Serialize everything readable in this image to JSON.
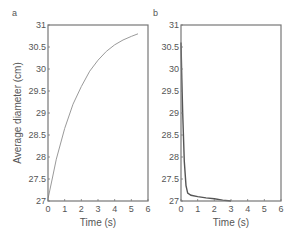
{
  "chart_data": [
    {
      "panel": "a",
      "type": "line",
      "title": "",
      "xlabel": "Time (s)",
      "ylabel": "Average diameter (cm)",
      "xlim": [
        0,
        6
      ],
      "ylim": [
        27,
        31
      ],
      "xticks": [
        0,
        1,
        2,
        3,
        4,
        5,
        6
      ],
      "yticks": [
        27,
        27.5,
        28,
        28.5,
        29,
        29.5,
        30,
        30.5,
        31
      ],
      "grid": false,
      "series": [
        {
          "name": "diameter",
          "color": "#9a9a9a",
          "x": [
            0,
            0.25,
            0.5,
            1,
            1.5,
            2,
            2.5,
            3,
            3.5,
            4,
            4.5,
            5,
            5.4
          ],
          "y": [
            27.05,
            27.5,
            27.95,
            28.65,
            29.2,
            29.6,
            29.95,
            30.2,
            30.4,
            30.55,
            30.66,
            30.74,
            30.8
          ]
        }
      ]
    },
    {
      "panel": "b",
      "type": "line",
      "title": "",
      "xlabel": "Time (s)",
      "ylabel": "",
      "xlim": [
        0,
        6
      ],
      "ylim": [
        27,
        31
      ],
      "xticks": [
        0,
        1,
        2,
        3,
        4,
        5,
        6
      ],
      "yticks": [
        27,
        27.5,
        28,
        28.5,
        29,
        29.5,
        30,
        30.5,
        31
      ],
      "grid": false,
      "series": [
        {
          "name": "diameter",
          "color": "#555555",
          "x": [
            0,
            0.05,
            0.1,
            0.2,
            0.3,
            0.4,
            0.6,
            1,
            1.5,
            2,
            2.5,
            3
          ],
          "y": [
            30.6,
            29.8,
            29.0,
            27.9,
            27.35,
            27.18,
            27.13,
            27.1,
            27.07,
            27.05,
            27.02,
            27.0
          ]
        }
      ]
    }
  ],
  "panels": {
    "a": {
      "label": "a"
    },
    "b": {
      "label": "b"
    }
  }
}
